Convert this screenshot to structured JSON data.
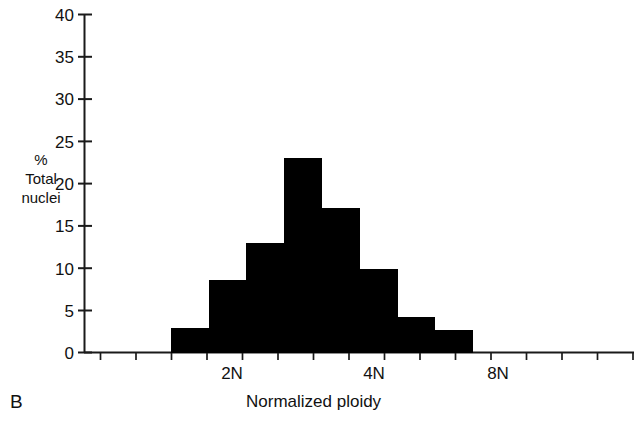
{
  "figure": {
    "panel_label": "B"
  },
  "chart_data": {
    "type": "bar",
    "title": "",
    "xlabel": "Normalized ploidy",
    "ylabel": "% Total nuclei",
    "ylabel_lines": [
      "%",
      "Total",
      "nuclei"
    ],
    "categories": [
      "1.4N",
      "1.7N",
      "2.1N",
      "2.6N",
      "3.3N",
      "4.1N",
      "5.1N",
      "6.4N"
    ],
    "values": [
      2.9,
      8.5,
      12.9,
      23.0,
      17.0,
      9.8,
      4.2,
      2.6
    ],
    "bar_color": "#000000",
    "bar_edge_color": "#000000",
    "grid": false,
    "legend": null,
    "ylim": [
      0,
      40
    ],
    "yticks": [
      0,
      5,
      10,
      15,
      20,
      25,
      30,
      35,
      40
    ],
    "ytick_labels": [
      "0",
      "5",
      "10",
      "15",
      "20",
      "25",
      "30",
      "35",
      "40"
    ],
    "x_scale": "log2",
    "xtick_labels": [
      "2N",
      "4N",
      "8N"
    ],
    "xtick_positions": [
      2,
      4,
      8
    ],
    "x_minor_tick_count": 14,
    "axis_color": "#1a1a1a"
  }
}
